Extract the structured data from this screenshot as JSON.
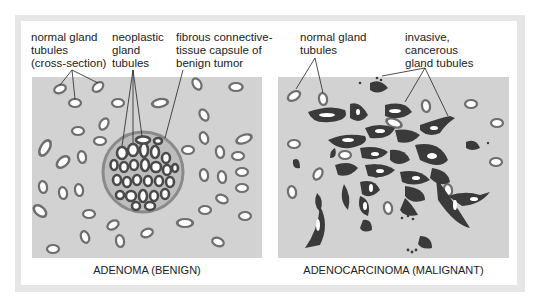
{
  "figure": {
    "left_panel": {
      "caption": "ADENOMA (BENIGN)",
      "labels": {
        "normal": [
          "normal gland",
          "tubules",
          "(cross-section)"
        ],
        "neoplastic": [
          "neoplastic",
          "gland",
          "tubules"
        ],
        "capsule": [
          "fibrous connective-",
          "tissue capsule of",
          "benign tumor"
        ]
      }
    },
    "right_panel": {
      "caption": "ADENOCARCINOMA (MALIGNANT)",
      "labels": {
        "normal": [
          "normal gland",
          "tubules"
        ],
        "invasive": [
          "invasive,",
          "cancerous",
          "gland tubules"
        ]
      }
    },
    "colors": {
      "tissue_bg": "#d2d2d2",
      "frame": "#e6e6e6",
      "normal_tubule_wall": "#7a7a7a",
      "cancer_tubule": "#3a3a3a",
      "lumen": "#ffffff",
      "capsule": "#8a8a8a"
    }
  }
}
